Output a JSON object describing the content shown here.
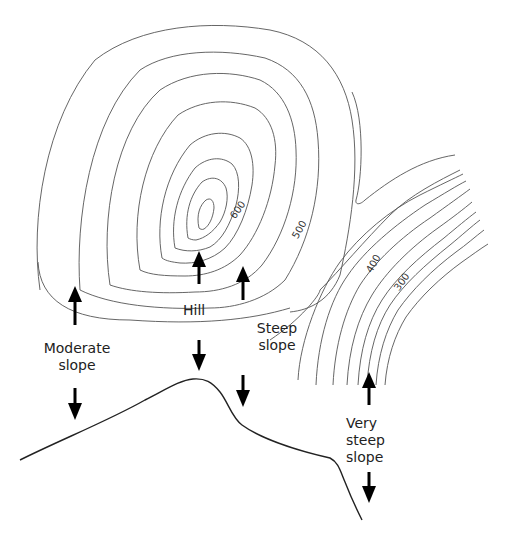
{
  "diagram": {
    "type": "topographic contour map with cross-section profile",
    "contour_labels": {
      "c600": "600",
      "c500": "500",
      "c400": "400",
      "c300": "300"
    },
    "labels": {
      "hill": "Hill",
      "moderate_line1": "Moderate",
      "moderate_line2": "slope",
      "steep_line1": "Steep",
      "steep_line2": "slope",
      "very_line1": "Very",
      "very_line2": "steep",
      "very_line3": "slope"
    },
    "colors": {
      "contour": "#555555",
      "profile": "#222222",
      "arrow": "#000000",
      "background": "#ffffff"
    }
  }
}
